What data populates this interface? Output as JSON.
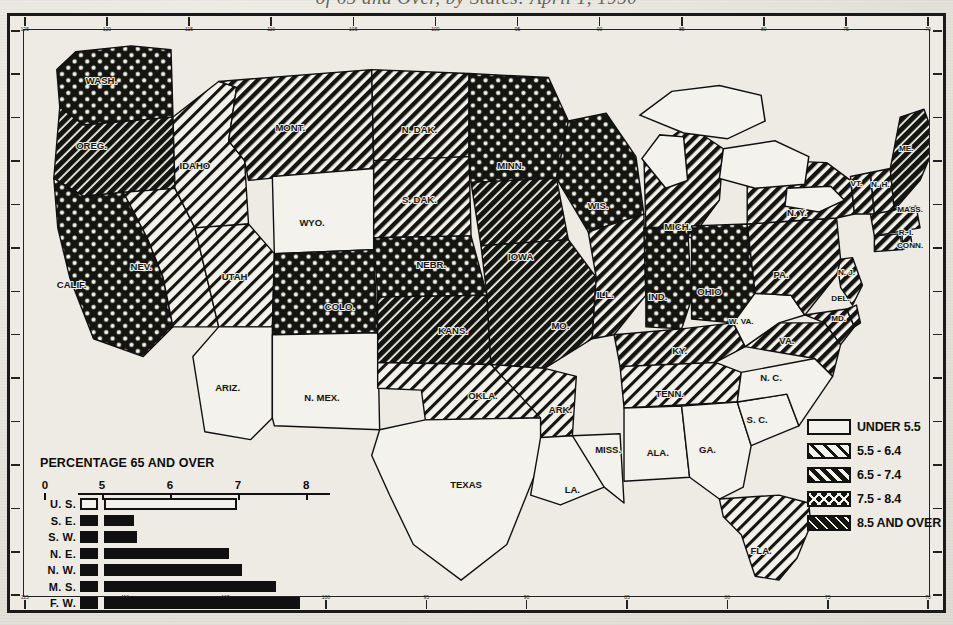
{
  "title": {
    "text": "of 65 and Over, by States: April 1, 1950",
    "note": "cut-off caption above map frame"
  },
  "legend": {
    "name": "map-legend",
    "entries": [
      {
        "label": "UNDER 5.5",
        "pattern": "blank"
      },
      {
        "label": "5.5 - 6.4",
        "pattern": "light-hatch"
      },
      {
        "label": "6.5 - 7.4",
        "pattern": "medium-hatch"
      },
      {
        "label": "7.5 - 8.4",
        "pattern": "cross-hatch"
      },
      {
        "label": "8.5 AND OVER",
        "pattern": "dense-hatch"
      }
    ]
  },
  "bar_chart_panel": {
    "title": "PERCENTAGE 65 AND OVER"
  },
  "chart_data": {
    "type": "bar",
    "title": "PERCENTAGE 65 AND OVER",
    "orientation": "horizontal",
    "xlabel": "",
    "ylabel": "",
    "axis_ticks": [
      0,
      5,
      6,
      7,
      8
    ],
    "axis_break_after": 0,
    "xlim": [
      4.65,
      8.35
    ],
    "categories": [
      "U. S.",
      "S. E.",
      "S. W.",
      "N. E.",
      "N. W.",
      "M. S.",
      "F. W."
    ],
    "values": [
      6.97,
      5.45,
      5.5,
      6.85,
      7.05,
      7.55,
      7.9
    ],
    "styles": [
      "open",
      "solid",
      "solid",
      "solid",
      "solid",
      "solid",
      "solid"
    ],
    "grid": false,
    "legend": "none"
  },
  "map": {
    "name": "us-choropleth-65-and-over",
    "border_ticks_top": [
      "125",
      "120",
      "115",
      "110",
      "105",
      "100",
      "95",
      "90",
      "85",
      "80",
      "75",
      "70"
    ],
    "border_ticks_bottom": [
      "115",
      "110",
      "105",
      "100",
      "95",
      "90",
      "85",
      "80",
      "75",
      "70"
    ],
    "states": [
      {
        "abbr": "WASH.",
        "class": "7.5 - 8.4",
        "x": 78,
        "y": 52
      },
      {
        "abbr": "OREG.",
        "class": "8.5 AND OVER",
        "x": 68,
        "y": 118
      },
      {
        "abbr": "CALIF.",
        "class": "7.5 - 8.4",
        "x": 48,
        "y": 258
      },
      {
        "abbr": "NEV.",
        "class": "5.5 - 6.4",
        "x": 118,
        "y": 240
      },
      {
        "abbr": "IDAHO",
        "class": "5.5 - 6.4",
        "x": 172,
        "y": 138
      },
      {
        "abbr": "MONT.",
        "class": "6.5 - 7.4",
        "x": 268,
        "y": 100
      },
      {
        "abbr": "WYO.",
        "class": "UNDER 5.5",
        "x": 290,
        "y": 196
      },
      {
        "abbr": "UTAH",
        "class": "5.5 - 6.4",
        "x": 212,
        "y": 250
      },
      {
        "abbr": "COLO.",
        "class": "7.5 - 8.4",
        "x": 318,
        "y": 280
      },
      {
        "abbr": "ARIZ.",
        "class": "UNDER 5.5",
        "x": 205,
        "y": 362
      },
      {
        "abbr": "N. MEX.",
        "class": "UNDER 5.5",
        "x": 300,
        "y": 372
      },
      {
        "abbr": "N. DAK.",
        "class": "6.5 - 7.4",
        "x": 398,
        "y": 102
      },
      {
        "abbr": "S. DAK.",
        "class": "6.5 - 7.4",
        "x": 398,
        "y": 172
      },
      {
        "abbr": "NEBR.",
        "class": "7.5 - 8.4",
        "x": 410,
        "y": 238
      },
      {
        "abbr": "KANS.",
        "class": "8.5 AND OVER",
        "x": 432,
        "y": 305
      },
      {
        "abbr": "OKLA.",
        "class": "5.5 - 6.4",
        "x": 462,
        "y": 370
      },
      {
        "abbr": "TEXAS",
        "class": "UNDER 5.5",
        "x": 445,
        "y": 460
      },
      {
        "abbr": "MINN.",
        "class": "7.5 - 8.4",
        "x": 490,
        "y": 138
      },
      {
        "abbr": "IOWA",
        "class": "8.5 AND OVER",
        "x": 500,
        "y": 230
      },
      {
        "abbr": "MO.",
        "class": "8.5 AND OVER",
        "x": 540,
        "y": 300
      },
      {
        "abbr": "ARK.",
        "class": "5.5 - 6.4",
        "x": 540,
        "y": 385
      },
      {
        "abbr": "LA.",
        "class": "UNDER 5.5",
        "x": 552,
        "y": 465
      },
      {
        "abbr": "MISS.",
        "class": "UNDER 5.5",
        "x": 588,
        "y": 425
      },
      {
        "abbr": "WIS.",
        "class": "7.5 - 8.4",
        "x": 578,
        "y": 178
      },
      {
        "abbr": "ILL.",
        "class": "6.5 - 7.4",
        "x": 585,
        "y": 268
      },
      {
        "abbr": "MICH.",
        "class": "6.5 - 7.4",
        "x": 658,
        "y": 200
      },
      {
        "abbr": "IND.",
        "class": "7.5 - 8.4",
        "x": 638,
        "y": 270
      },
      {
        "abbr": "OHIO",
        "class": "7.5 - 8.4",
        "x": 690,
        "y": 265
      },
      {
        "abbr": "KY.",
        "class": "6.5 - 7.4",
        "x": 660,
        "y": 325
      },
      {
        "abbr": "TENN.",
        "class": "5.5 - 6.4",
        "x": 650,
        "y": 368
      },
      {
        "abbr": "ALA.",
        "class": "UNDER 5.5",
        "x": 638,
        "y": 428
      },
      {
        "abbr": "GA.",
        "class": "UNDER 5.5",
        "x": 688,
        "y": 425
      },
      {
        "abbr": "FLA.",
        "class": "5.5 - 6.4",
        "x": 742,
        "y": 527
      },
      {
        "abbr": "S. C.",
        "class": "UNDER 5.5",
        "x": 738,
        "y": 395
      },
      {
        "abbr": "N. C.",
        "class": "UNDER 5.5",
        "x": 752,
        "y": 352
      },
      {
        "abbr": "VA.",
        "class": "6.5 - 7.4",
        "x": 768,
        "y": 315
      },
      {
        "abbr": "W. VA.",
        "class": "UNDER 5.5",
        "x": 722,
        "y": 295
      },
      {
        "abbr": "MD.",
        "class": "6.5 - 7.4",
        "x": 820,
        "y": 292
      },
      {
        "abbr": "DEL.",
        "class": "6.5 - 7.4",
        "x": 822,
        "y": 272
      },
      {
        "abbr": "N. J.",
        "class": "6.5 - 7.4",
        "x": 828,
        "y": 245
      },
      {
        "abbr": "PA.",
        "class": "6.5 - 7.4",
        "x": 762,
        "y": 248
      },
      {
        "abbr": "N. Y.",
        "class": "6.5 - 7.4",
        "x": 778,
        "y": 185
      },
      {
        "abbr": "CONN.",
        "class": "6.5 - 7.4",
        "x": 892,
        "y": 218
      },
      {
        "abbr": "R. I.",
        "class": "6.5 - 7.4",
        "x": 888,
        "y": 205
      },
      {
        "abbr": "MASS.",
        "class": "6.5 - 7.4",
        "x": 892,
        "y": 182
      },
      {
        "abbr": "VT.",
        "class": "6.5 - 7.4",
        "x": 838,
        "y": 156
      },
      {
        "abbr": "N. H.",
        "class": "6.5 - 7.4",
        "x": 862,
        "y": 157
      },
      {
        "abbr": "ME.",
        "class": "8.5 AND OVER",
        "x": 888,
        "y": 120
      }
    ]
  },
  "colors": {
    "ink": "#101010",
    "paper": "#edebe4",
    "frame": "#1a1a1a"
  }
}
